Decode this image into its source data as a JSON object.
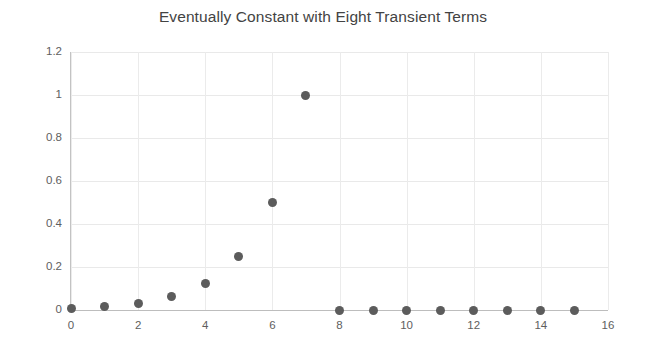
{
  "chart_data": {
    "type": "scatter",
    "title": "Eventually Constant with Eight Transient Terms",
    "xlabel": "",
    "ylabel": "",
    "x": [
      0,
      1,
      2,
      3,
      4,
      5,
      6,
      7,
      8,
      9,
      10,
      11,
      12,
      13,
      14,
      15
    ],
    "values": [
      0.0078,
      0.0156,
      0.0313,
      0.0625,
      0.125,
      0.25,
      0.5,
      1,
      0,
      0,
      0,
      0,
      0,
      0,
      0,
      0
    ],
    "series": [
      {
        "name": "sequence",
        "values": [
          0.0078,
          0.0156,
          0.0313,
          0.0625,
          0.125,
          0.25,
          0.5,
          1,
          0,
          0,
          0,
          0,
          0,
          0,
          0,
          0
        ],
        "color": "#5c5c5c"
      }
    ],
    "xlim": [
      0,
      16
    ],
    "ylim": [
      0,
      1.2
    ],
    "xticks": [
      0,
      2,
      4,
      6,
      8,
      10,
      12,
      14,
      16
    ],
    "xtick_labels": [
      "0",
      "2",
      "4",
      "6",
      "8",
      "10",
      "12",
      "14",
      "16"
    ],
    "yticks": [
      0,
      0.2,
      0.4,
      0.6,
      0.8,
      1,
      1.2
    ],
    "ytick_labels": [
      "0",
      "0.2",
      "0.4",
      "0.6",
      "0.8",
      "1",
      "1.2"
    ],
    "grid": true,
    "grid_axis": "both",
    "legend": null,
    "legend_position": "none",
    "marker": "circle",
    "marker_color": "#5c5c5c",
    "grid_color": "#e9e9e9",
    "axis_color": "#c3c3c3",
    "title_color": "#434343",
    "tick_label_color": "#5e5e5e",
    "background": "#ffffff"
  }
}
